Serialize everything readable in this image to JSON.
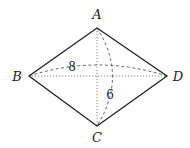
{
  "diagram": {
    "type": "rhombus-folding",
    "colors": {
      "stroke": "#222222",
      "dashed": "#555555",
      "dotted": "#777777",
      "background": "#ffffff"
    },
    "vertices": {
      "A": {
        "label": "A",
        "x": 97,
        "y": 28,
        "label_x": 97,
        "label_y": 19
      },
      "B": {
        "label": "B",
        "x": 29,
        "y": 76,
        "label_x": 17,
        "label_y": 81
      },
      "C": {
        "label": "C",
        "x": 97,
        "y": 126,
        "label_x": 97,
        "label_y": 142
      },
      "D": {
        "label": "D",
        "x": 167,
        "y": 76,
        "label_x": 178,
        "label_y": 81
      }
    },
    "edges": [
      "AB",
      "BC",
      "CD",
      "DA"
    ],
    "diagonals": {
      "AC": {
        "style": "dotted"
      },
      "BD": {
        "style": "dotted"
      }
    },
    "arcs": {
      "BD_arc": {
        "style": "dashed",
        "label": "8",
        "label_x": 72,
        "label_y": 71
      },
      "AC_arc": {
        "style": "dashed",
        "label": "6",
        "label_x": 110,
        "label_y": 99
      }
    }
  }
}
